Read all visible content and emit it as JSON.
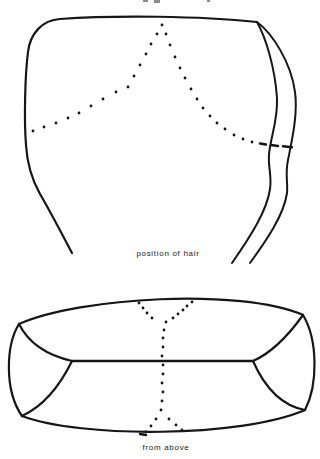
{
  "page": {
    "background": "#ffffff",
    "ink": "#161616",
    "dot_radius": 1.4,
    "dash_width": 2.4,
    "clipped_header_marks": [
      {
        "x": 143,
        "y": 0,
        "w": 5,
        "h": 2
      },
      {
        "x": 154,
        "y": 0,
        "w": 6,
        "h": 3
      },
      {
        "x": 207,
        "y": 0,
        "w": 3,
        "h": 2
      }
    ]
  },
  "figures": [
    {
      "id": "front-view",
      "caption": "position of hair",
      "solid_paths": [
        {
          "d": "M 257,22 C 200,16 115,15 60,19 C 42,20 30,34 28,52 C 25,75 24,120 26,145 C 27,162 31,178 40,194 C 50,211 62,234 72,253",
          "w": 2.2
        },
        {
          "d": "M 257,22 C 266,38 275,68 277,98 C 278,122 270,138 269,155 C 268,167 272,176 270,189 C 267,211 250,237 232,263",
          "w": 2
        },
        {
          "d": "M 257,22 C 272,33 291,62 295,92 C 298,114 292,140 288,160 C 285,174 288,183 287,193 C 284,215 266,241 250,263",
          "w": 2
        }
      ],
      "dot_chains": [
        {
          "dots": [
            [
              162,
              25
            ],
            [
              157,
              34
            ],
            [
              151,
              44
            ],
            [
              146,
              54
            ],
            [
              140,
              65
            ],
            [
              134,
              76
            ],
            [
              128,
              87
            ],
            [
              116,
              92
            ],
            [
              103,
              99
            ],
            [
              91,
              106
            ],
            [
              79,
              113
            ],
            [
              68,
              118
            ],
            [
              56,
              123
            ],
            [
              44,
              127
            ],
            [
              33,
              131
            ]
          ]
        },
        {
          "dots": [
            [
              166,
              34
            ],
            [
              170,
              45
            ],
            [
              175,
              57
            ],
            [
              180,
              68
            ],
            [
              185,
              78
            ],
            [
              191,
              89
            ],
            [
              197,
              99
            ],
            [
              203,
              108
            ],
            [
              210,
              116
            ],
            [
              217,
              123
            ],
            [
              225,
              129
            ],
            [
              234,
              135
            ],
            [
              243,
              139
            ],
            [
              252,
              142
            ]
          ]
        }
      ],
      "dashes": [
        {
          "x1": 260,
          "y1": 143.5,
          "x2": 266,
          "y2": 144.5
        },
        {
          "x1": 271,
          "y1": 145,
          "x2": 278,
          "y2": 146
        },
        {
          "x1": 283,
          "y1": 146.3,
          "x2": 292,
          "y2": 147.3
        }
      ]
    },
    {
      "id": "top-view",
      "caption": "from above",
      "solid_paths": [
        {
          "d": "M 19,324 C 80,297 240,288 303,315",
          "w": 2.2
        },
        {
          "d": "M 22,416 C 80,438 240,438 305,410",
          "w": 2.2
        },
        {
          "d": "M 19,324 C 6,345 4,390 22,416",
          "w": 2.2
        },
        {
          "d": "M 303,315 C 318,340 318,385 305,410",
          "w": 2.2
        },
        {
          "d": "M 19,324 Q 33,352 72,361",
          "w": 2.2
        },
        {
          "d": "M 303,315 Q 278,350 253,361",
          "w": 2.2
        },
        {
          "d": "M 72,361 Q 52,402 22,416",
          "w": 2.2
        },
        {
          "d": "M 253,361 Q 272,404 305,410",
          "w": 2.2
        },
        {
          "d": "M 72,361 L 253,361",
          "w": 2.4
        }
      ],
      "dot_chains": [
        {
          "dots": [
            [
              139,
              303
            ],
            [
              143,
              308
            ],
            [
              147,
              313
            ],
            [
              152,
              318
            ]
          ]
        },
        {
          "dots": [
            [
              192,
              302
            ],
            [
              187,
              306
            ],
            [
              183,
              310
            ],
            [
              178,
              314
            ],
            [
              173,
              318
            ]
          ]
        },
        {
          "dots": [
            [
              166,
              322
            ],
            [
              164,
              330
            ],
            [
              163,
              338
            ],
            [
              163,
              347
            ],
            [
              162,
              356
            ],
            [
              163,
              365
            ],
            [
              163,
              374
            ],
            [
              162,
              383
            ],
            [
              163,
              392
            ],
            [
              162,
              401
            ],
            [
              161,
              410
            ]
          ]
        },
        {
          "dots": [
            [
              156,
              419
            ],
            [
              151,
              426
            ],
            [
              146,
              432
            ]
          ]
        },
        {
          "dots": [
            [
              169,
              419
            ],
            [
              176,
              425
            ],
            [
              182,
              430
            ]
          ]
        }
      ],
      "dashes": [
        {
          "x1": 140,
          "y1": 434,
          "x2": 146,
          "y2": 435
        }
      ]
    }
  ]
}
